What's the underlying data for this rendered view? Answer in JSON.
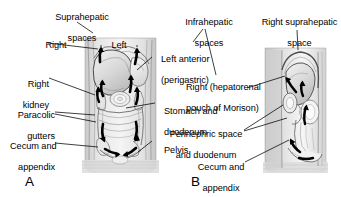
{
  "figure": {
    "background_color": "#ffffff",
    "ink_color": "#000000",
    "panels": [
      {
        "id": "A",
        "id_label": "A",
        "view": "coronal-anterior-abdomen",
        "caption_note": "Anterior (coronal) view of abdomen showing peritoneal spaces and arrows of fluid flow"
      },
      {
        "id": "B",
        "id_label": "B",
        "view": "sagittal-lateral-abdomen",
        "caption_note": "Lateral (sagittal) view of abdomen showing peritoneal spaces and arrows of fluid flow"
      }
    ]
  },
  "labels_panel_a": [
    {
      "key": "suprahepatic_spaces",
      "line1": "Suprahepatic",
      "line2": "spaces",
      "align": "center"
    },
    {
      "key": "right",
      "line1": "Right",
      "line2": "",
      "align": "center"
    },
    {
      "key": "left",
      "line1": "Left",
      "line2": "",
      "align": "center"
    },
    {
      "key": "right_kidney",
      "line1": "Right",
      "line2": "kidney",
      "align": "right"
    },
    {
      "key": "paracolic_gutters",
      "line1": "Paracolic",
      "line2": "gutters",
      "align": "right"
    },
    {
      "key": "cecum_and_appendix",
      "line1": "Cecum and",
      "line2": "appendix",
      "align": "right"
    },
    {
      "key": "left_anterior_perigastric",
      "line1": "Left anterior",
      "line2": "(perigastric)",
      "align": "left"
    },
    {
      "key": "stomach_and_duodenum",
      "line1": "Stomach and",
      "line2": "duodenum",
      "align": "left"
    },
    {
      "key": "pelvis",
      "line1": "Pelvis",
      "line2": "",
      "align": "left"
    }
  ],
  "labels_panel_b": [
    {
      "key": "infrahepatic_spaces",
      "line1": "Infrahepatic",
      "line2": "spaces",
      "align": "center"
    },
    {
      "key": "right_hepatorenal_morison",
      "line1": "Right (hepatorenal",
      "line2": "pouch of Morison)",
      "align": "left"
    },
    {
      "key": "right_suprahepatic_space",
      "line1": "Right suprahepatic",
      "line2": "space",
      "align": "center"
    },
    {
      "key": "perinephric_space_and_duodenum",
      "line1": "Perinephric space",
      "line2": "and duodenum",
      "align": "center"
    },
    {
      "key": "cecum_and_appendix_b",
      "line1": "Cecum and",
      "line2": "appendix",
      "align": "center"
    }
  ],
  "panel_ids": {
    "a": "A",
    "b": "B"
  }
}
